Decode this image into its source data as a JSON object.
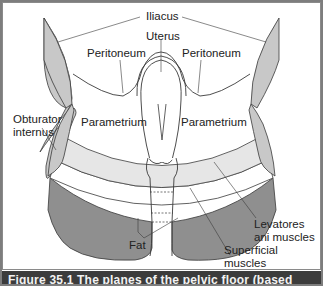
{
  "figure": {
    "labels": {
      "iliacus": "Iliacus",
      "uterus": "Uterus",
      "peritoneum_left": "Peritoneum",
      "peritoneum_right": "Peritoneum",
      "obturator_line1": "Obturator",
      "obturator_line2": "internus",
      "parametrium_left": "Parametrium",
      "parametrium_right": "Parametrium",
      "levatores_line1": "Levatores",
      "levatores_line2": "ani muscles",
      "fat": "Fat",
      "superficial_line1": "Superficial",
      "superficial_line2": "muscles"
    },
    "caption": "Figure 35.1 The planes of the pelvic floor (based",
    "colors": {
      "muscle_light": "#c8c8c8",
      "levator_band": "#e6e6e6",
      "superficial_band": "#8f8f8f",
      "outline": "#3a3a3a",
      "caption_bg": "#3c3c3c"
    }
  }
}
